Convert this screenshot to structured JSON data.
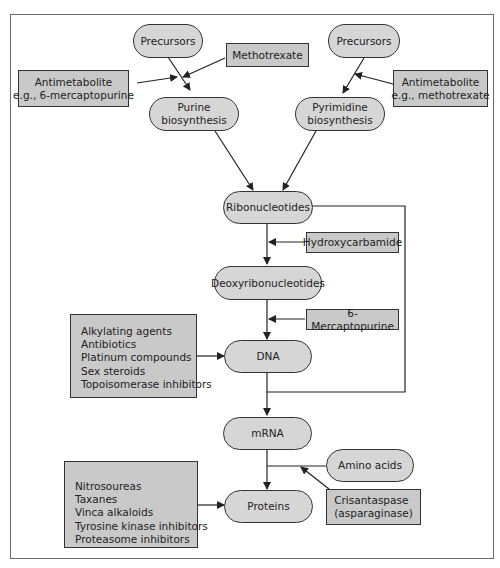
{
  "diagram": {
    "nodes": {
      "precursors_left": "Precursors",
      "precursors_right": "Precursors",
      "purine_biosynthesis": [
        "Purine",
        "biosynthesis"
      ],
      "pyrimidine_biosynthesis": [
        "Pyrimidine",
        "biosynthesis"
      ],
      "ribonucleotides": "Ribonucleotides",
      "deoxyribonucleotides": "Deoxyribonucleotides",
      "dna": "DNA",
      "mrna": "mRNA",
      "amino_acids": "Amino acids",
      "proteins": "Proteins"
    },
    "inhibitors": {
      "methotrexate": "Methotrexate",
      "antimetabolite_left": [
        "Antimetabolite",
        "e.g., 6-mercaptopurine"
      ],
      "antimetabolite_right": [
        "Antimetabolite",
        "e.g., methotrexate"
      ],
      "hydroxycarbamide": "Hydroxycarbamide",
      "mercaptopurine": "6-Mercaptopurine",
      "dna_agents": [
        "Alkylating agents",
        "Antibiotics",
        "Platinum compounds",
        "Sex steroids",
        "Topoisomerase inhibitors"
      ],
      "protein_agents": [
        "Nitrosoureas",
        "Taxanes",
        "Vinca alkaloids",
        "Tyrosine kinase inhibitors",
        "Proteasome inhibitors"
      ],
      "crisantaspase": [
        "Crisantaspase",
        "(asparaginase)"
      ]
    },
    "colors": {
      "node_fill": "#d6d6d6",
      "inhibitor_fill": "#c9c9c9",
      "stroke": "#333333"
    }
  }
}
